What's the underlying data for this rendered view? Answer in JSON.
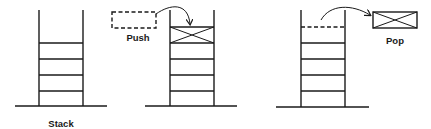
{
  "diagram": {
    "colors": {
      "stroke": "#1a1a1a",
      "background": "#ffffff"
    },
    "panels": [
      {
        "id": "stack",
        "label": "Stack",
        "slots": 4,
        "description": "Empty stack with four slots"
      },
      {
        "id": "push",
        "label": "Push",
        "slots": 5,
        "incoming_item": "dashed-box",
        "top_item": "crossed-box",
        "description": "Item pushed onto top of stack"
      },
      {
        "id": "pop",
        "label": "Pop",
        "slots": 4,
        "removed_slot": "dashed-line",
        "outgoing_item": "crossed-box",
        "description": "Top item popped off the stack"
      }
    ]
  }
}
